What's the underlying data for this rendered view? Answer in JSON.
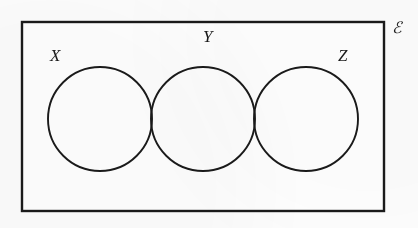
{
  "diagram": {
    "type": "venn",
    "title_symbol": "ℰ",
    "universe_label": "ℰ",
    "universe_label_name": "universal-set-symbol",
    "stroke_color": "#1a1a1a",
    "fill_color": "#ffffff",
    "background_color": "#fdfdfd",
    "rectangle": {
      "label": "ℰ",
      "x": 22,
      "y": 22,
      "width": 362,
      "height": 189,
      "stroke_width": 2.4
    },
    "sets": [
      {
        "label": "X",
        "name": "circle-x",
        "cx": 100,
        "cy": 119,
        "r": 52,
        "stroke_width": 1.9
      },
      {
        "label": "Y",
        "name": "circle-y",
        "cx": 203,
        "cy": 119,
        "r": 52,
        "stroke_width": 1.9
      },
      {
        "label": "Z",
        "name": "circle-z",
        "cx": 306,
        "cy": 119,
        "r": 52,
        "stroke_width": 1.9
      }
    ],
    "overlaps": [
      {
        "name": "x-and-y",
        "between": [
          "X",
          "Y"
        ]
      },
      {
        "name": "y-and-z",
        "between": [
          "Y",
          "Z"
        ]
      }
    ],
    "notes": {
      "x_and_z_disjoint": "X and Z do not overlap",
      "no_triple_intersection": "There is no region common to X, Y and Z"
    }
  }
}
